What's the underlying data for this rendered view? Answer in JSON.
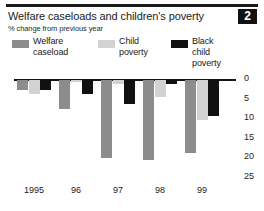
{
  "badge": {
    "number": "2"
  },
  "header": {
    "title": "Welfare caseloads and children's poverty",
    "subtitle": "% change from previous year"
  },
  "legend": {
    "position": "top",
    "items": [
      {
        "label": "Welfare\ncaseload",
        "color": "#8c8c8c",
        "name": "welfare-caseload"
      },
      {
        "label": "Child\npoverty",
        "color": "#d2d2d2",
        "name": "child-poverty"
      },
      {
        "label": "Black child\npoverty",
        "color": "#111111",
        "name": "black-child-poverty"
      }
    ]
  },
  "chart_data": {
    "type": "bar",
    "title": "Welfare caseloads and children's poverty",
    "subtitle": "% change from previous year",
    "xlabel": "",
    "ylabel": "% change from previous year",
    "ylim": [
      0,
      25
    ],
    "y_inverted": true,
    "note": "All values are negative changes plotted downward from the 0 line; tick labels are unsigned.",
    "grid": false,
    "categories": [
      "1995",
      "96",
      "97",
      "98",
      "99"
    ],
    "yticks": [
      "0",
      "5",
      "10",
      "15",
      "20",
      "25"
    ],
    "series": [
      {
        "name": "Welfare caseload",
        "color": "#8c8c8c",
        "values": [
          2.6,
          7.4,
          20.0,
          20.3,
          18.5
        ]
      },
      {
        "name": "Child poverty",
        "color": "#d2d2d2",
        "values": [
          3.6,
          0.6,
          1.1,
          4.3,
          10.3
        ]
      },
      {
        "name": "Black child poverty",
        "color": "#111111",
        "values": [
          2.6,
          3.6,
          6.2,
          0.9,
          9.3
        ]
      }
    ]
  }
}
